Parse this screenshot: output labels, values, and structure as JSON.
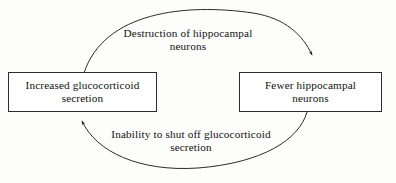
{
  "diagram": {
    "type": "cycle-flow-diagram",
    "background_color": "#fdfdfc",
    "line_color": "#2b2b2b",
    "text_color": "#111111",
    "nodes": [
      {
        "id": "increased-glucocorticoid-secretion",
        "text": "Increased glucocorticoid\nsecretion",
        "shape": "rectangle"
      },
      {
        "id": "fewer-hippocampal-neurons",
        "text": "Fewer hippocampal\nneurons",
        "shape": "rectangle"
      }
    ],
    "edges": [
      {
        "id": "top-edge",
        "label": "Destruction of hippocampal\nneurons",
        "from": "increased-glucocorticoid-secretion",
        "to": "fewer-hippocampal-neurons",
        "arrowhead": "at-target"
      },
      {
        "id": "bottom-edge",
        "label": "Inability to shut off glucocorticoid\nsecretion",
        "from": "fewer-hippocampal-neurons",
        "to": "increased-glucocorticoid-secretion",
        "arrowhead": "at-target"
      }
    ]
  }
}
